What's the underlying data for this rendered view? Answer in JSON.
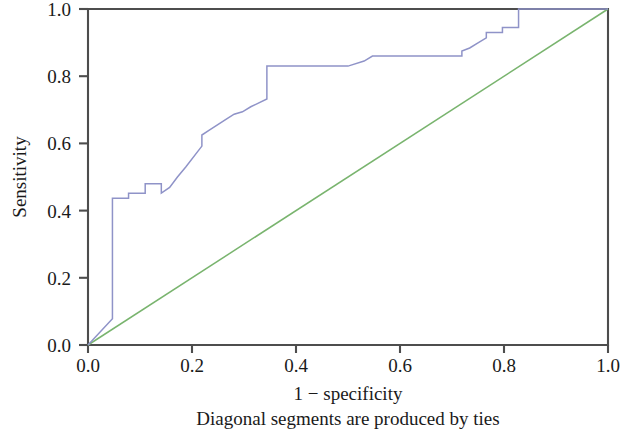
{
  "chart_data": {
    "type": "line",
    "title": "",
    "xlabel": "1 − specificity",
    "ylabel": "Sensitivity",
    "caption": "Diagonal segments are produced by ties",
    "xlim": [
      0.0,
      1.0
    ],
    "ylim": [
      0.0,
      1.0
    ],
    "grid": false,
    "legend": "none",
    "x_ticks": [
      "0.0",
      "0.2",
      "0.4",
      "0.6",
      "0.8",
      "1.0"
    ],
    "x_tick_values": [
      0.0,
      0.2,
      0.4,
      0.6,
      0.8,
      1.0
    ],
    "y_ticks": [
      "0.0",
      "0.2",
      "0.4",
      "0.6",
      "0.8",
      "1.0"
    ],
    "y_tick_values": [
      0.0,
      0.2,
      0.4,
      0.6,
      0.8,
      1.0
    ],
    "series": [
      {
        "name": "ROC curve",
        "color": "#8f93c8",
        "x": [
          0.0,
          0.047,
          0.047,
          0.078,
          0.078,
          0.11,
          0.11,
          0.141,
          0.141,
          0.157,
          0.172,
          0.188,
          0.219,
          0.219,
          0.234,
          0.266,
          0.281,
          0.297,
          0.313,
          0.344,
          0.344,
          0.5,
          0.531,
          0.547,
          0.547,
          0.719,
          0.719,
          0.734,
          0.75,
          0.766,
          0.766,
          0.781,
          0.797,
          0.797,
          0.828,
          0.828,
          1.0
        ],
        "y": [
          0.0,
          0.078,
          0.437,
          0.437,
          0.452,
          0.452,
          0.48,
          0.48,
          0.452,
          0.469,
          0.5,
          0.53,
          0.592,
          0.625,
          0.64,
          0.672,
          0.687,
          0.694,
          0.709,
          0.732,
          0.83,
          0.83,
          0.845,
          0.86,
          0.86,
          0.86,
          0.875,
          0.884,
          0.899,
          0.914,
          0.93,
          0.93,
          0.93,
          0.945,
          0.945,
          1.0,
          1.0
        ]
      },
      {
        "name": "Reference line",
        "color": "#79b46e",
        "x": [
          0.0,
          1.0
        ],
        "y": [
          0.0,
          1.0
        ]
      }
    ]
  },
  "axes": {
    "x_axis_label": "1 − specificity",
    "y_axis_label": "Sensitivity",
    "caption": "Diagonal segments are produced by ties"
  },
  "colors": {
    "roc_curve": "#8f93c8",
    "reference_line": "#79b46e",
    "frame": "#4d4d4d",
    "text": "#1a1a1a",
    "background": "#ffffff"
  }
}
